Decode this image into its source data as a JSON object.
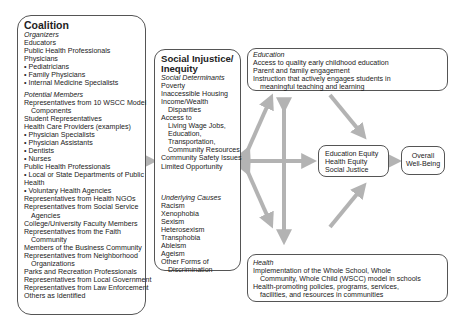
{
  "coalition": {
    "title": "Coalition",
    "organizers_heading": "Organizers",
    "organizers": [
      {
        "text": "Educators",
        "indent": false
      },
      {
        "text": "Public Health Professionals",
        "indent": false
      },
      {
        "text": "Physicians",
        "indent": false
      },
      {
        "text": "• Pediatricians",
        "indent": false
      },
      {
        "text": "• Family Physicians",
        "indent": false
      },
      {
        "text": "• Internal Medicine Specialists",
        "indent": false
      }
    ],
    "members_heading": "Potential Members",
    "members": [
      {
        "text": "Representatives from 10 WSCC Model",
        "indent": false
      },
      {
        "text": "Components",
        "indent": true
      },
      {
        "text": "Student Representatives",
        "indent": false
      },
      {
        "text": "Health Care Providers (examples)",
        "indent": false
      },
      {
        "text": "• Physician Specialists",
        "indent": false
      },
      {
        "text": "• Physician Assistants",
        "indent": false
      },
      {
        "text": "• Dentists",
        "indent": false
      },
      {
        "text": "• Nurses",
        "indent": false
      },
      {
        "text": "Public Health Professionals",
        "indent": false
      },
      {
        "text": "• Local or State Departments of Public",
        "indent": false
      },
      {
        "text": "Health",
        "indent": false
      },
      {
        "text": "• Voluntary Health Agencies",
        "indent": false
      },
      {
        "text": "Representatives from Health NGOs",
        "indent": false
      },
      {
        "text": "Representatives from Social Service",
        "indent": false
      },
      {
        "text": "Agencies",
        "indent": true
      },
      {
        "text": "College/University Faculty Members",
        "indent": false
      },
      {
        "text": "Representatives from the Faith",
        "indent": false
      },
      {
        "text": "Community",
        "indent": true
      },
      {
        "text": "Members of the Business Community",
        "indent": false
      },
      {
        "text": "Representatives from Neighborhood",
        "indent": false
      },
      {
        "text": "Organizations",
        "indent": true
      },
      {
        "text": "Parks and Recreation Professionals",
        "indent": false
      },
      {
        "text": "Representatives from Local Government",
        "indent": false
      },
      {
        "text": "Representatives from Law Enforcement",
        "indent": false
      },
      {
        "text": "Others as Identified",
        "indent": false
      }
    ]
  },
  "social_injustice": {
    "title_line1": "Social Injustice/",
    "title_line2": "Inequity",
    "determinants_heading": "Social Determinants",
    "determinants": [
      {
        "text": "Poverty",
        "indent": 0
      },
      {
        "text": "Inaccessible Housing",
        "indent": 0
      },
      {
        "text": "Income/Wealth",
        "indent": 0
      },
      {
        "text": "Disparities",
        "indent": 1
      },
      {
        "text": "Access to",
        "indent": 0
      },
      {
        "text": "Living Wage Jobs,",
        "indent": 1
      },
      {
        "text": "Education,",
        "indent": 1
      },
      {
        "text": "Transportation,",
        "indent": 1
      },
      {
        "text": "Community Resources",
        "indent": 1
      },
      {
        "text": "Community Safety Issues",
        "indent": 0
      },
      {
        "text": "Limited Opportunity",
        "indent": 0
      }
    ],
    "causes_heading": "Underlying Causes",
    "causes": [
      {
        "text": "Racism",
        "indent": 0
      },
      {
        "text": "Xenophobia",
        "indent": 0
      },
      {
        "text": "Sexism",
        "indent": 0
      },
      {
        "text": "Heterosexism",
        "indent": 0
      },
      {
        "text": "Transphobia",
        "indent": 0
      },
      {
        "text": "Ableism",
        "indent": 0
      },
      {
        "text": "Ageism",
        "indent": 0
      },
      {
        "text": "Other Forms of",
        "indent": 0
      },
      {
        "text": "Discrimination",
        "indent": 1
      }
    ]
  },
  "education": {
    "heading": "Education",
    "items": [
      {
        "text": "Access to quality early childhood education",
        "indent": false
      },
      {
        "text": "Parent and family engagement",
        "indent": false
      },
      {
        "text": "Instruction that actively engages students in",
        "indent": false
      },
      {
        "text": "meaningful teaching and learning",
        "indent": true
      }
    ]
  },
  "health": {
    "heading": "Health",
    "items": [
      {
        "text": "Implementation of the Whole School, Whole",
        "indent": false
      },
      {
        "text": "Community, Whole Child (WSCC) model in schools",
        "indent": true
      },
      {
        "text": "Health-promoting policies, programs, services,",
        "indent": false
      },
      {
        "text": "facilities, and resources in communities",
        "indent": true
      }
    ]
  },
  "equity": {
    "lines": [
      "Education Equity",
      "Health Equity",
      "Social Justice"
    ]
  },
  "outcome": {
    "line1": "Overall",
    "line2": "Well-Being"
  },
  "colors": {
    "arrow": "#b3b3b3",
    "border": "#555555",
    "text": "#222222"
  }
}
